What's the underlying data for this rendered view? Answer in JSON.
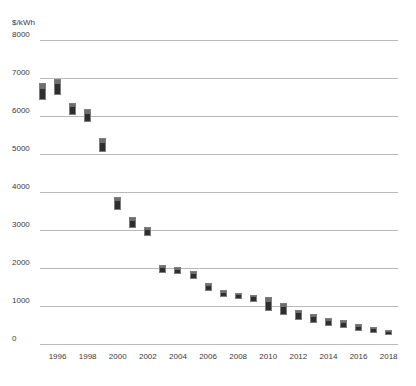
{
  "chart_data": {
    "type": "bar",
    "title": "",
    "subtitle": "",
    "xlabel": "",
    "ylabel": "$/kWh",
    "ylim": [
      0,
      8000
    ],
    "xlim": [
      1995,
      2018
    ],
    "grid": true,
    "legend": null,
    "y_ticks": [
      0,
      1000,
      2000,
      3000,
      4000,
      5000,
      6000,
      7000,
      8000
    ],
    "y_tick_labels": [
      "0",
      "1000",
      "2000",
      "3000",
      "4000",
      "5000",
      "6000",
      "7000",
      "8000"
    ],
    "x_ticks": [
      1996,
      1998,
      2000,
      2002,
      2004,
      2006,
      2008,
      2010,
      2012,
      2014,
      2016,
      2018
    ],
    "x_tick_labels": [
      "1996",
      "1998",
      "2000",
      "2002",
      "2004",
      "2006",
      "2008",
      "2010",
      "2012",
      "2014",
      "2016",
      "2018"
    ],
    "series": [
      {
        "name": "price range",
        "low": [
          6420,
          6550,
          6020,
          5850,
          5050,
          3520,
          3050,
          2850,
          1870,
          1840,
          1720,
          1400,
          1230,
          1180,
          1100,
          870,
          760,
          640,
          560,
          480,
          420,
          330,
          290,
          230
        ],
        "high": [
          6870,
          6980,
          6350,
          6180,
          5420,
          3880,
          3350,
          3080,
          2080,
          2030,
          1920,
          1600,
          1420,
          1340,
          1300,
          1230,
          1080,
          900,
          790,
          690,
          620,
          520,
          460,
          380
        ]
      }
    ],
    "categories": [
      1995,
      1996,
      1997,
      1998,
      1999,
      2000,
      2001,
      2002,
      2003,
      2004,
      2005,
      2006,
      2007,
      2008,
      2009,
      2010,
      2011,
      2012,
      2013,
      2014,
      2015,
      2016,
      2017,
      2018
    ]
  },
  "style": {
    "bar_color": "#2e2e2e",
    "bar_cap_color": "#6e6e6e",
    "grid_color": "#b9b9b9",
    "text_color": "#3a3a3a",
    "background": "#ffffff"
  }
}
